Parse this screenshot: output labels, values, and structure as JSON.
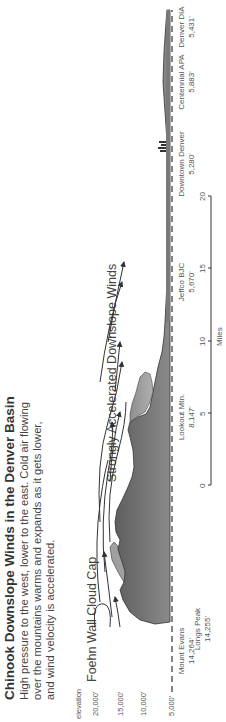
{
  "title": "Chinook Downslope Winds in the Denver Basin",
  "description": "High pressure to the west, lower to the east. Cold air flowing over the mountains warms and expands as it gets lower, and wind velocity is accelerated.",
  "annotations": {
    "cloud_cap": "Foehn Wall Cloud Cap",
    "downslope": "Strongly Accelerated Downslope Winds"
  },
  "elevation_axis": {
    "label": "elevation",
    "ticks": [
      "20,000'",
      "15,000'",
      "10,000'",
      "5,000'"
    ]
  },
  "locations": [
    {
      "name": "Mount Evans",
      "elevation": "14,264'"
    },
    {
      "name": "Longs Peak",
      "elevation": "14,255'"
    },
    {
      "name": "Lookout Mtn.",
      "elevation": "8,147'"
    },
    {
      "name": "Jeffco BJC",
      "elevation": "5,670'"
    },
    {
      "name": "Downtown Denver",
      "elevation": "5,280'"
    },
    {
      "name": "Centennial APA",
      "elevation": "5,883'"
    },
    {
      "name": "Denver DIA",
      "elevation": "5,431'"
    }
  ],
  "scale": {
    "ticks": [
      "0",
      "5",
      "10",
      "15",
      "20"
    ],
    "unit": "Miles"
  },
  "colors": {
    "terrain_dark": "#6e6e6e",
    "terrain_light": "#9a9a9a",
    "lines": "#333333"
  }
}
